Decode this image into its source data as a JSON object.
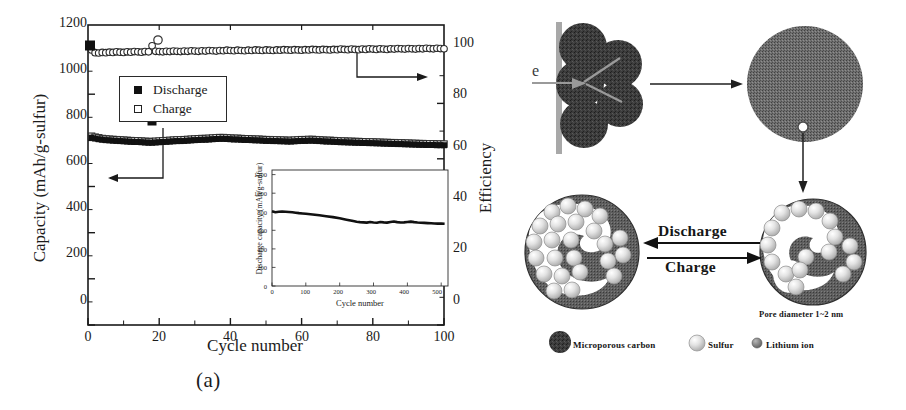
{
  "figure": {
    "panel_a_caption": "(a)",
    "panel_b_caption": "(b)"
  },
  "panel_a": {
    "legend": {
      "discharge_label": "Discharge",
      "charge_label": "Charge"
    },
    "y_axis_left_title": "Capacity (mAh/g-sulfur)",
    "y_axis_right_title": "Efficiency",
    "x_axis_title": "Cycle number",
    "y_left_ticks": [
      "0",
      "200",
      "400",
      "600",
      "800",
      "1000",
      "1200"
    ],
    "y_right_ticks": [
      "0",
      "20",
      "40",
      "60",
      "80",
      "100"
    ],
    "x_ticks": [
      "0",
      "20",
      "40",
      "60",
      "80",
      "100"
    ],
    "inset": {
      "y_axis_title": "Discharge capacity (mAh/g-sulfur)",
      "x_axis_title": "Cycle number",
      "annotation": "Current density: 400 mA/g",
      "y_ticks": [
        "0",
        "200",
        "400",
        "600",
        "800",
        "1000",
        "1200"
      ],
      "x_ticks": [
        "0",
        "100",
        "200",
        "300",
        "400",
        "500"
      ]
    }
  },
  "panel_b": {
    "electron_label": "e",
    "discharge_label": "Discharge",
    "charge_label": "Charge",
    "pore_label": "Pore diameter 1~2 nm",
    "legend": {
      "carbon_label": "Microporous carbon",
      "sulfur_label": "Sulfur",
      "lithium_label": "Lithium ion"
    },
    "colors": {
      "carbon_dark": "#3b3b3b",
      "carbon_speckle": "#6b6b6b",
      "sulfur": "#d9d9d9",
      "lithium": "#8a8a8a",
      "collector": "#a8a8a8"
    }
  },
  "chart_data": [
    {
      "type": "line",
      "title": "",
      "xlabel": "Cycle number",
      "ylabel": "Capacity (mAh/g-sulfur)",
      "y2label": "Efficiency",
      "xlim": [
        0,
        100
      ],
      "ylim": [
        0,
        1300
      ],
      "y2lim": [
        0,
        108.3
      ],
      "grid": false,
      "legend_position": "upper-left-inside",
      "series": [
        {
          "name": "Discharge",
          "marker": "filled-square",
          "axis": "left",
          "x": [
            1,
            2,
            3,
            4,
            5,
            6,
            7,
            8,
            9,
            10,
            11,
            12,
            13,
            14,
            15,
            16,
            17,
            18,
            19,
            20,
            21,
            22,
            23,
            24,
            25,
            26,
            27,
            28,
            29,
            30,
            31,
            32,
            33,
            34,
            35,
            36,
            37,
            38,
            39,
            40,
            41,
            42,
            43,
            44,
            45,
            46,
            47,
            48,
            49,
            50,
            51,
            52,
            53,
            54,
            55,
            56,
            57,
            58,
            59,
            60,
            61,
            62,
            63,
            64,
            65,
            66,
            67,
            68,
            69,
            70,
            71,
            72,
            73,
            74,
            75,
            76,
            77,
            78,
            79,
            80,
            81,
            82,
            83,
            84,
            85,
            86,
            87,
            88,
            89,
            90,
            91,
            92,
            93,
            94,
            95,
            96,
            97,
            98,
            99,
            100
          ],
          "y": [
            812,
            808,
            805,
            803,
            801,
            800,
            799,
            798,
            797,
            796,
            795,
            794,
            793,
            793,
            792,
            791,
            790,
            790,
            791,
            792,
            793,
            794,
            795,
            796,
            797,
            797,
            798,
            799,
            800,
            801,
            802,
            803,
            803,
            804,
            805,
            806,
            807,
            807,
            806,
            805,
            804,
            804,
            803,
            802,
            802,
            801,
            800,
            800,
            799,
            798,
            798,
            797,
            797,
            796,
            796,
            795,
            795,
            796,
            797,
            798,
            798,
            799,
            799,
            798,
            797,
            796,
            795,
            795,
            794,
            793,
            792,
            792,
            791,
            791,
            790,
            790,
            789,
            789,
            788,
            788,
            787,
            787,
            786,
            786,
            785,
            785,
            784,
            784,
            783,
            783,
            782,
            782,
            781,
            781,
            780,
            780,
            780,
            779,
            779,
            779
          ]
        },
        {
          "name": "Charge",
          "marker": "open-square",
          "axis": "left",
          "x": [
            1,
            2,
            3,
            4,
            5,
            6,
            7,
            8,
            9,
            10,
            11,
            12,
            13,
            14,
            15,
            16,
            17,
            18,
            19,
            20,
            21,
            22,
            23,
            24,
            25,
            26,
            27,
            28,
            29,
            30,
            31,
            32,
            33,
            34,
            35,
            36,
            37,
            38,
            39,
            40,
            41,
            42,
            43,
            44,
            45,
            46,
            47,
            48,
            49,
            50,
            51,
            52,
            53,
            54,
            55,
            56,
            57,
            58,
            59,
            60,
            61,
            62,
            63,
            64,
            65,
            66,
            67,
            68,
            69,
            70,
            71,
            72,
            73,
            74,
            75,
            76,
            77,
            78,
            79,
            80,
            81,
            82,
            83,
            84,
            85,
            86,
            87,
            88,
            89,
            90,
            91,
            92,
            93,
            94,
            95,
            96,
            97,
            98,
            99,
            100
          ],
          "y": [
            818,
            814,
            811,
            808,
            806,
            805,
            804,
            803,
            802,
            801,
            800,
            799,
            798,
            798,
            797,
            796,
            795,
            795,
            796,
            797,
            798,
            799,
            800,
            801,
            802,
            802,
            803,
            804,
            805,
            806,
            807,
            808,
            808,
            809,
            810,
            811,
            812,
            812,
            811,
            810,
            809,
            809,
            808,
            807,
            807,
            806,
            805,
            805,
            804,
            803,
            803,
            802,
            802,
            801,
            801,
            800,
            800,
            801,
            802,
            803,
            803,
            804,
            804,
            803,
            802,
            801,
            800,
            800,
            799,
            798,
            797,
            797,
            796,
            796,
            795,
            795,
            794,
            794,
            793,
            793,
            792,
            792,
            791,
            791,
            790,
            790,
            789,
            789,
            788,
            788,
            787,
            787,
            786,
            786,
            785,
            785,
            785,
            784,
            784,
            784
          ]
        },
        {
          "name": "Efficiency",
          "marker": "open-circle",
          "axis": "right",
          "x": [
            1,
            2,
            3,
            4,
            5,
            6,
            7,
            8,
            9,
            10,
            11,
            12,
            13,
            14,
            15,
            16,
            17,
            18,
            19,
            20,
            21,
            22,
            23,
            24,
            25,
            26,
            27,
            28,
            29,
            30,
            31,
            32,
            33,
            34,
            35,
            36,
            37,
            38,
            39,
            40,
            41,
            42,
            43,
            44,
            45,
            46,
            47,
            48,
            49,
            50,
            51,
            52,
            53,
            54,
            55,
            56,
            57,
            58,
            59,
            60,
            61,
            62,
            63,
            64,
            65,
            66,
            67,
            68,
            69,
            70,
            71,
            72,
            73,
            74,
            75,
            76,
            77,
            78,
            79,
            80,
            81,
            82,
            83,
            84,
            85,
            86,
            87,
            88,
            89,
            90,
            91,
            92,
            93,
            94,
            95,
            96,
            97,
            98,
            99,
            100
          ],
          "y": [
            99.3,
            98.3,
            98.2,
            98.4,
            98.3,
            98.5,
            98.4,
            98.6,
            98.5,
            98.4,
            98.6,
            98.5,
            98.7,
            98.6,
            98.5,
            98.7,
            98.6,
            100.8,
            98.8,
            98.7,
            98.6,
            98.8,
            98.7,
            98.9,
            98.8,
            98.7,
            98.9,
            98.8,
            99.0,
            98.9,
            98.8,
            99.0,
            98.9,
            99.1,
            99.0,
            98.9,
            99.1,
            99.0,
            99.2,
            99.1,
            99.0,
            99.2,
            99.1,
            99.0,
            99.2,
            99.1,
            99.3,
            99.2,
            99.1,
            99.3,
            99.2,
            99.1,
            99.3,
            99.2,
            99.4,
            99.3,
            99.2,
            99.4,
            99.3,
            99.2,
            99.4,
            99.3,
            99.5,
            99.4,
            99.3,
            99.5,
            99.4,
            99.3,
            99.5,
            99.4,
            99.6,
            99.5,
            99.4,
            99.6,
            99.5,
            99.4,
            99.6,
            99.5,
            99.7,
            99.6,
            99.5,
            99.7,
            99.6,
            99.5,
            99.7,
            99.6,
            99.8,
            99.7,
            99.6,
            99.8,
            99.7,
            99.6,
            99.8,
            99.7,
            99.9,
            99.8,
            99.7,
            99.9,
            99.8,
            99.7
          ]
        }
      ],
      "annotations": [
        {
          "text": "arrow pointing left to capacity axis",
          "type": "axis-pointer"
        },
        {
          "text": "arrow pointing right to efficiency axis",
          "type": "axis-pointer"
        }
      ]
    },
    {
      "type": "line",
      "title": "",
      "xlabel": "Cycle number",
      "ylabel": "Discharge capacity (mAh/g-sulfur)",
      "annotation": "Current density: 400 mA/g",
      "xlim": [
        0,
        520
      ],
      "ylim": [
        0,
        1250
      ],
      "grid": false,
      "inset_of": "main",
      "series": [
        {
          "name": "Discharge capacity",
          "x": [
            0,
            10,
            20,
            30,
            40,
            50,
            60,
            70,
            80,
            90,
            100,
            120,
            140,
            160,
            180,
            200,
            220,
            240,
            250,
            260,
            280,
            290,
            300,
            310,
            320,
            330,
            340,
            350,
            360,
            370,
            380,
            390,
            400,
            410,
            420,
            430,
            440,
            450,
            460,
            470,
            480,
            490,
            500,
            510
          ],
          "y": [
            805,
            795,
            800,
            802,
            800,
            798,
            795,
            790,
            785,
            782,
            778,
            770,
            762,
            752,
            742,
            730,
            715,
            700,
            692,
            688,
            683,
            690,
            685,
            682,
            690,
            686,
            683,
            690,
            695,
            688,
            684,
            686,
            690,
            694,
            688,
            684,
            682,
            680,
            678,
            676,
            674,
            672,
            672,
            670
          ]
        }
      ]
    }
  ]
}
